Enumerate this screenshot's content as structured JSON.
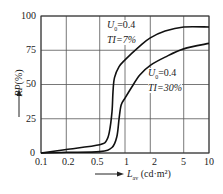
{
  "chart_data": {
    "type": "line",
    "title": "",
    "xlabel": "L_av (cd·m²)",
    "ylabel": "RP (%)",
    "xscale": "log",
    "xlim": [
      0.1,
      10
    ],
    "ylim": [
      0,
      100
    ],
    "grid": true,
    "x_ticks": [
      "0.1",
      "0.2",
      "0.5",
      "1",
      "2",
      "5",
      "10"
    ],
    "y_ticks": [
      "0",
      "25",
      "50",
      "75",
      "100"
    ],
    "series": [
      {
        "name": "U0=0.4 TI=7%",
        "points": [
          [
            0.1,
            0
          ],
          [
            0.2,
            2.5
          ],
          [
            0.5,
            6
          ],
          [
            0.6,
            9
          ],
          [
            0.65,
            15
          ],
          [
            0.7,
            30
          ],
          [
            0.72,
            45
          ],
          [
            0.75,
            55
          ],
          [
            0.85,
            63
          ],
          [
            1,
            68
          ],
          [
            1.5,
            78
          ],
          [
            2,
            84
          ],
          [
            3,
            89
          ],
          [
            5,
            92
          ],
          [
            10,
            92
          ]
        ]
      },
      {
        "name": "U0=0.4 TI=30%",
        "points": [
          [
            0.1,
            0
          ],
          [
            0.2,
            0.5
          ],
          [
            0.5,
            1
          ],
          [
            0.7,
            4
          ],
          [
            0.8,
            12
          ],
          [
            0.85,
            25
          ],
          [
            0.9,
            35
          ],
          [
            1,
            40
          ],
          [
            1.2,
            48
          ],
          [
            1.5,
            57
          ],
          [
            2,
            64
          ],
          [
            3,
            70
          ],
          [
            5,
            76
          ],
          [
            10,
            80
          ]
        ]
      }
    ],
    "annotations": [
      {
        "text_line1": "U0=0.4",
        "text_line2": "TI=7%"
      },
      {
        "text_line1": "U0=0.4",
        "text_line2": "TI=30%"
      }
    ]
  },
  "labels": {
    "y_axis_main": "RP",
    "y_axis_unit": "(%)",
    "x_axis_main": "L",
    "x_axis_sub": "av",
    "x_axis_unit": "(cd·m²)",
    "ann1_l1_a": "U",
    "ann1_l1_sub": "0",
    "ann1_l1_b": "=0.4",
    "ann1_l2": "TI=7%",
    "ann2_l1_a": "U",
    "ann2_l1_sub": "0",
    "ann2_l1_b": "=0.4",
    "ann2_l2": "TI=30%",
    "xt0": "0.1",
    "xt1": "0.2",
    "xt2": "0.5",
    "xt3": "1",
    "xt4": "2",
    "xt5": "5",
    "xt6": "10",
    "yt0": "0",
    "yt1": "25",
    "yt2": "50",
    "yt3": "75",
    "yt4": "100"
  }
}
